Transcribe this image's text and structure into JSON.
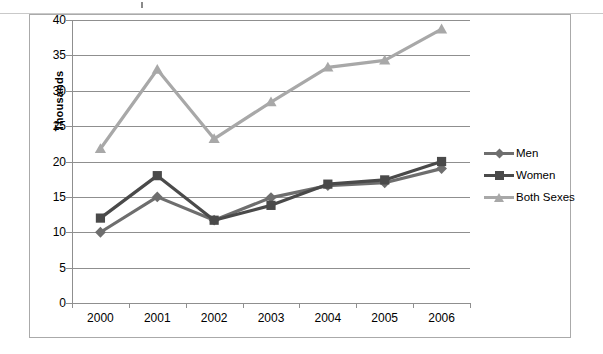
{
  "chart_data": {
    "type": "line",
    "title": "",
    "xlabel": "",
    "ylabel": "Thousands",
    "categories": [
      "2000",
      "2001",
      "2002",
      "2003",
      "2004",
      "2005",
      "2006"
    ],
    "ylim": [
      0,
      40
    ],
    "ytick_step": 5,
    "yticks": [
      "0",
      "5",
      "10",
      "15",
      "20",
      "25",
      "30",
      "35",
      "40"
    ],
    "grid": true,
    "legend_position": "right",
    "series": [
      {
        "name": "Men",
        "color": "#6e6e6e",
        "marker": "diamond",
        "values": [
          10.0,
          15.0,
          11.7,
          14.9,
          16.6,
          17.0,
          19.0
        ]
      },
      {
        "name": "Women",
        "color": "#4a4a4a",
        "marker": "square",
        "values": [
          12.0,
          18.0,
          11.7,
          13.8,
          16.8,
          17.4,
          20.0
        ]
      },
      {
        "name": "Both Sexes",
        "color": "#a8a8a8",
        "marker": "triangle",
        "values": [
          21.8,
          33.0,
          23.2,
          28.4,
          33.3,
          34.3,
          38.7
        ]
      }
    ]
  },
  "legend": {
    "items": [
      {
        "label": "Men"
      },
      {
        "label": "Women"
      },
      {
        "label": "Both Sexes"
      }
    ]
  },
  "axis": {
    "y_title": "Thousands"
  },
  "colors": {
    "men": "#6e6e6e",
    "women": "#4a4a4a",
    "both_sexes": "#a8a8a8",
    "grid": "#8f8f8f",
    "frame": "#aaaaaa",
    "background": "#ffffff"
  }
}
